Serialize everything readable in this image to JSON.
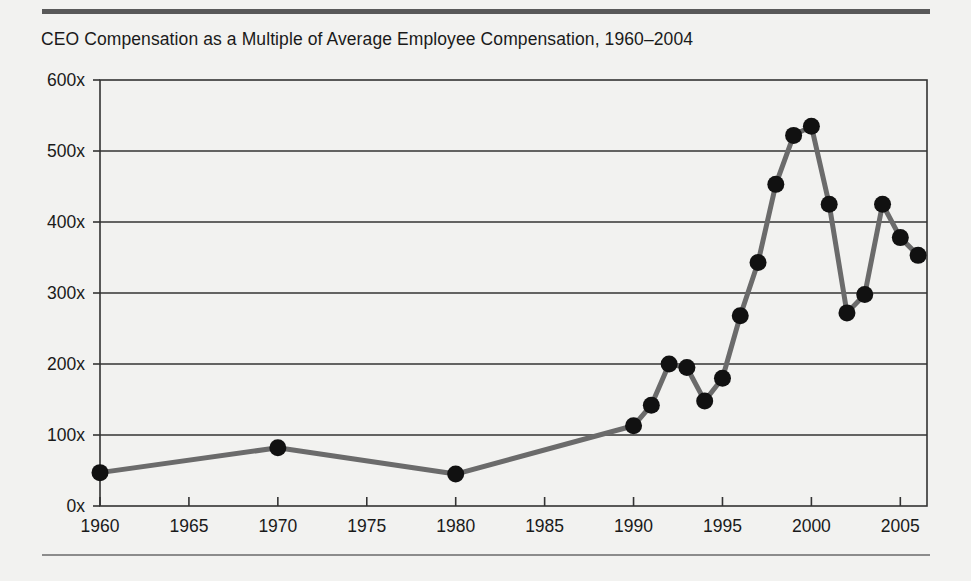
{
  "chart_data": {
    "type": "line",
    "title": "CEO Compensation as a Multiple of Average Employee Compensation, 1960–2004",
    "xlabel": "",
    "ylabel": "",
    "xlim": [
      1960,
      2006.5
    ],
    "ylim": [
      0,
      600
    ],
    "grid": true,
    "grid_axis": "y",
    "legend": "none",
    "y_ticks": [
      0,
      100,
      200,
      300,
      400,
      500,
      600
    ],
    "y_tick_labels": [
      "0x",
      "100x",
      "200x",
      "300x",
      "400x",
      "500x",
      "600x"
    ],
    "x_ticks": [
      1960,
      1965,
      1970,
      1975,
      1980,
      1985,
      1990,
      1995,
      2000,
      2005
    ],
    "x_tick_labels": [
      "1960",
      "1965",
      "1970",
      "1975",
      "1980",
      "1985",
      "1990",
      "1995",
      "2000",
      "2005"
    ],
    "x": [
      1960,
      1970,
      1980,
      1990,
      1991,
      1992,
      1993,
      1994,
      1995,
      1996,
      1997,
      1998,
      1999,
      2000,
      2001,
      2002,
      2003,
      2004,
      2005,
      2006
    ],
    "values": [
      47,
      82,
      45,
      113,
      142,
      200,
      195,
      148,
      180,
      268,
      343,
      453,
      522,
      535,
      425,
      272,
      298,
      425,
      378,
      353
    ],
    "series": [
      {
        "name": "CEO pay as multiple of average employee pay",
        "x": [
          1960,
          1970,
          1980,
          1990,
          1991,
          1992,
          1993,
          1994,
          1995,
          1996,
          1997,
          1998,
          1999,
          2000,
          2001,
          2002,
          2003,
          2004,
          2005,
          2006
        ],
        "values": [
          47,
          82,
          45,
          113,
          142,
          200,
          195,
          148,
          180,
          268,
          343,
          453,
          522,
          535,
          425,
          272,
          298,
          425,
          378,
          353
        ]
      }
    ],
    "colors": {
      "line": "#6b6b6b",
      "marker": "#111111",
      "axis": "#333333",
      "grid": "#333333",
      "background": "#f2f2f0",
      "rule_top": "#595959",
      "rule_bottom": "#8c8c8c",
      "text": "#1a1a1a"
    }
  },
  "icons": {}
}
